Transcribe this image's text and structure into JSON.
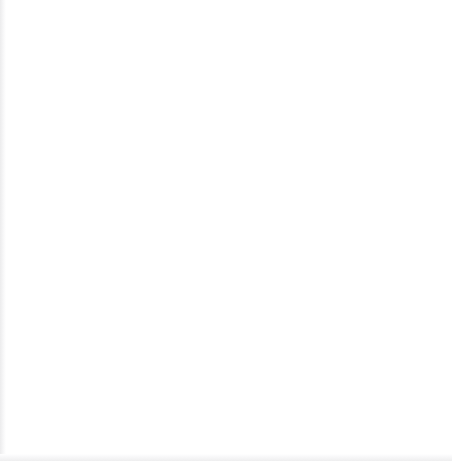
{
  "canvas": {
    "width": 452,
    "height": 461,
    "background_color": "#ffffff"
  },
  "diagram": {
    "type": "radial-cluster",
    "title": "",
    "nodes": [
      {
        "id": "top",
        "name": "reconciler-node",
        "label": "I am a\nreconciler.",
        "shape": "circle",
        "center_x": 230.5,
        "center_y": 96.5,
        "radius": 92,
        "border_style": "diamond-chain",
        "border_color": "#4a4a52",
        "diamond_size": 7.6,
        "fill_color": "#ffffff",
        "text_color": "#1b1b1b",
        "font_size": 17
      },
      {
        "id": "bottom-left",
        "name": "empty-node-left",
        "label": "",
        "shape": "circle",
        "center_x": 115,
        "center_y": 334,
        "radius": 105,
        "border_style": "diamond-chain",
        "border_color": "#7b7b88",
        "diamond_size": 5.2,
        "fill_color": "#ffffff"
      },
      {
        "id": "bottom-right",
        "name": "empty-node-right",
        "label": "",
        "shape": "circle",
        "center_x": 338,
        "center_y": 314,
        "radius": 106,
        "border_style": "diamond-chain",
        "border_color": "#7b7b88",
        "diamond_size": 5.2,
        "fill_color": "#ffffff"
      }
    ],
    "connectors": [
      {
        "id": "top-to-bottom-left",
        "name": "connector-top-to-left",
        "from": "top",
        "to": "bottom-left",
        "x1": 176,
        "y1": 172,
        "x2": 151,
        "y2": 237,
        "color": "#2f2f33",
        "width": 1.4
      },
      {
        "id": "top-to-bottom-right",
        "name": "connector-top-to-right",
        "from": "top",
        "to": "bottom-right",
        "x1": 277,
        "y1": 172,
        "x2": 304,
        "y2": 214,
        "color": "#2f2f33",
        "width": 1.4
      }
    ]
  },
  "artifacts": {
    "cropped_top_text": "",
    "left_edge_color": "#ececed",
    "bottom_edge_color": "#eeeeef"
  }
}
